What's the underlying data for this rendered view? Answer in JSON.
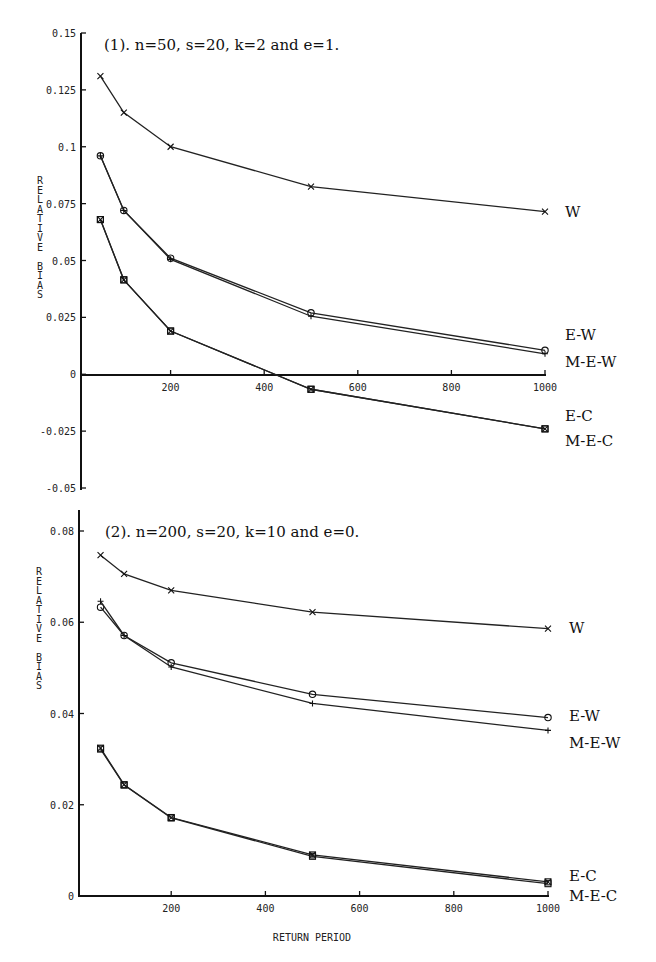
{
  "chart_data": [
    {
      "type": "line",
      "title": "(1). n=50, s=20, k=2 and e=1.",
      "xlabel": "",
      "ylabel": "RELATIVE BIAS",
      "x": [
        50,
        100,
        200,
        500,
        1000
      ],
      "xlim": [
        0,
        1000
      ],
      "ylim": [
        -0.05,
        0.15
      ],
      "xticks": [
        200,
        400,
        600,
        800,
        1000
      ],
      "xtick_labels": [
        "200",
        "400",
        "600",
        "800",
        "1000"
      ],
      "yticks": [
        0.15,
        0.125,
        0.1,
        0.075,
        0.05,
        0.025,
        0,
        -0.025,
        -0.05
      ],
      "ytick_labels": [
        "0.15",
        "0.125",
        "0.1",
        "0.075",
        "0.05",
        "0.025",
        "0",
        "-0.025",
        "-0.05"
      ],
      "grid": false,
      "legend_position": "inline-right",
      "series": [
        {
          "name": "W",
          "marker": "x",
          "values": [
            0.131,
            0.115,
            0.1,
            0.0825,
            0.0715
          ]
        },
        {
          "name": "E-W",
          "marker": "o",
          "values": [
            0.096,
            0.072,
            0.051,
            0.027,
            0.0105
          ]
        },
        {
          "name": "M-E-W",
          "marker": "+",
          "values": [
            0.096,
            0.072,
            0.0505,
            0.0255,
            0.009
          ]
        },
        {
          "name": "E-C",
          "marker": "square",
          "values": [
            0.068,
            0.0415,
            0.019,
            -0.0066,
            -0.024
          ]
        },
        {
          "name": "M-E-C",
          "marker": "square-x",
          "values": [
            0.068,
            0.0415,
            0.019,
            -0.0066,
            -0.024
          ]
        }
      ]
    },
    {
      "type": "line",
      "title": "(2). n=200, s=20, k=10 and e=0.",
      "xlabel": "RETURN PERIOD",
      "ylabel": "RELATIVE BIAS",
      "x": [
        50,
        100,
        200,
        500,
        1000
      ],
      "xlim": [
        0,
        1000
      ],
      "ylim": [
        0,
        0.08
      ],
      "xticks": [
        200,
        400,
        600,
        800,
        1000
      ],
      "xtick_labels": [
        "200",
        "400",
        "600",
        "800",
        "1000"
      ],
      "yticks": [
        0.08,
        0.06,
        0.04,
        0.02,
        0
      ],
      "ytick_labels": [
        "0.08",
        "0.06",
        "0.04",
        "0.02",
        "0"
      ],
      "grid": false,
      "legend_position": "inline-right",
      "series": [
        {
          "name": "W",
          "marker": "x",
          "values": [
            0.0747,
            0.0706,
            0.067,
            0.0622,
            0.0586
          ]
        },
        {
          "name": "E-W",
          "marker": "o",
          "values": [
            0.0633,
            0.0571,
            0.0511,
            0.0442,
            0.0391
          ]
        },
        {
          "name": "M-E-W",
          "marker": "+",
          "values": [
            0.0646,
            0.0571,
            0.0502,
            0.0422,
            0.0363
          ]
        },
        {
          "name": "E-C",
          "marker": "square-x",
          "values": [
            0.0324,
            0.0244,
            0.0172,
            0.009,
            0.0031
          ]
        },
        {
          "name": "M-E-C",
          "marker": "square",
          "values": [
            0.0322,
            0.0243,
            0.0171,
            0.0087,
            0.0027
          ]
        }
      ]
    }
  ],
  "labels": {
    "chart1_title": "(1). n=50, s=20, k=2 and e=1.",
    "chart2_title": "(2). n=200, s=20, k=10 and e=0.",
    "ylabel_letters": [
      "R",
      "E",
      "L",
      "A",
      "T",
      "I",
      "V",
      "E",
      "",
      "B",
      "I",
      "A",
      "S"
    ],
    "xlabel": "RETURN PERIOD"
  }
}
